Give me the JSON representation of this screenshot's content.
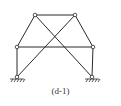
{
  "caption": "(d-1)",
  "colors": {
    "stroke": "#2a2a2a",
    "joint_fill": "#ffffff",
    "background": "#ffffff"
  },
  "joints": [
    {
      "id": "top-left",
      "x": 35,
      "y": 15
    },
    {
      "id": "top-right",
      "x": 75,
      "y": 15
    },
    {
      "id": "mid-left",
      "x": 17,
      "y": 47
    },
    {
      "id": "mid-right",
      "x": 93,
      "y": 47
    },
    {
      "id": "support-left",
      "x": 17,
      "y": 77
    },
    {
      "id": "support-right",
      "x": 92,
      "y": 77
    }
  ],
  "members": [
    [
      "top-left",
      "top-right"
    ],
    [
      "top-left",
      "mid-left"
    ],
    [
      "top-right",
      "mid-right"
    ],
    [
      "mid-left",
      "mid-right"
    ],
    [
      "mid-left",
      "support-left"
    ],
    [
      "mid-right",
      "support-right"
    ],
    [
      "top-left",
      "support-right"
    ],
    [
      "top-right",
      "support-left"
    ]
  ],
  "supports": [
    "support-left",
    "support-right"
  ]
}
